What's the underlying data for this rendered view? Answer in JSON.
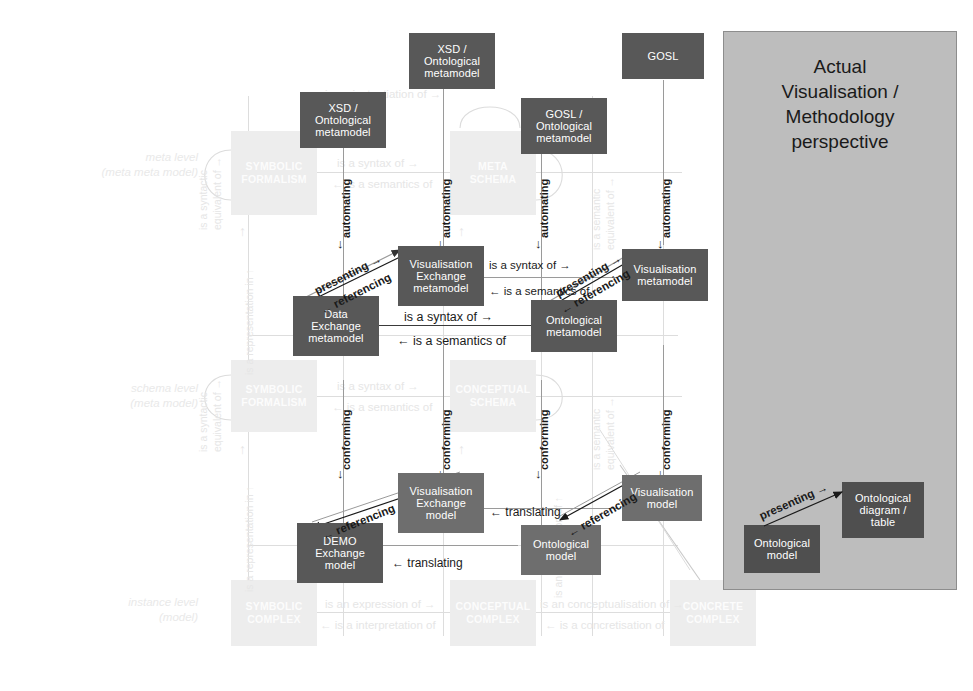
{
  "overlay_panel": {
    "title": "Actual\nVisualisation /\nMethodology\nperspective",
    "bg_color": "#bdbdbd",
    "boxes": [
      {
        "label": "Ontological\nmodel"
      },
      {
        "label": "Ontological\ndiagram /\ntable"
      }
    ],
    "relation": "presenting →"
  },
  "level_labels": [
    {
      "text": "meta level\n(meta meta model)"
    },
    {
      "text": "schema level\n(meta model)"
    },
    {
      "text": "instance level\n(model)"
    }
  ],
  "framework_boxes": [
    {
      "label": "SYMBOLIC\nFORMALISM"
    },
    {
      "label": "META\nSCHEMA"
    },
    {
      "label": "SYMBOLIC\nFORMALISM"
    },
    {
      "label": "CONCEPTUAL\nSCHEMA"
    },
    {
      "label": "SYMBOLIC\nCOMPLEX"
    },
    {
      "label": "CONCEPTUAL\nCOMPLEX"
    },
    {
      "label": "CONCRETE\nCOMPLEX"
    }
  ],
  "dark_boxes": [
    {
      "label": "XSD /\nOntological\nmetamodel"
    },
    {
      "label": "XSD /\nOntological\nmetamodel"
    },
    {
      "label": "GOSL /\nOntological\nmetamodel"
    },
    {
      "label": "GOSL"
    },
    {
      "label": "Visualisation\nExchange\nmetamodel"
    },
    {
      "label": "Data\nExchange\nmetamodel"
    },
    {
      "label": "Ontological\nmetamodel"
    },
    {
      "label": "Visualisation\nmetamodel"
    },
    {
      "label": "Visualisation\nExchange\nmodel"
    },
    {
      "label": "DEMO\nExchange\nmodel"
    },
    {
      "label": "Ontological\nmodel"
    },
    {
      "label": "Visualisation\nmodel"
    }
  ],
  "ghost_relations": [
    {
      "text": "is an instantiation of →"
    },
    {
      "text": "is a syntax of →"
    },
    {
      "text": "← is a semantics of"
    },
    {
      "text": "is a syntax of →"
    },
    {
      "text": "← is a semantics of"
    },
    {
      "text": "is an expression of →"
    },
    {
      "text": "← is a interpretation of"
    },
    {
      "text": "is an conceptualisation of →"
    },
    {
      "text": "← is a concretisation of"
    },
    {
      "text": "is a syntactic\nequivalent of →"
    },
    {
      "text": "is a syntactic\nequivalent of →"
    },
    {
      "text": "is a representation in ↑"
    },
    {
      "text": "is a representation in ↑"
    },
    {
      "text": "is a semantic\nequivalent of →"
    },
    {
      "text": "is a semantic\nequivalent of →"
    },
    {
      "text": "is an instantiation of ↑"
    }
  ],
  "strong_relations": [
    {
      "text": "is a syntax of →"
    },
    {
      "text": "← is a semantics of"
    },
    {
      "text": "is a syntax of →"
    },
    {
      "text": "← is a semantics of"
    },
    {
      "text": "← translating"
    },
    {
      "text": "← translating"
    },
    {
      "text": "automating"
    },
    {
      "text": "automating"
    },
    {
      "text": "automating"
    },
    {
      "text": "automating"
    },
    {
      "text": "conforming"
    },
    {
      "text": "conforming"
    },
    {
      "text": "conforming"
    },
    {
      "text": "conforming"
    },
    {
      "text": "presenting →"
    },
    {
      "text": "← referencing"
    },
    {
      "text": "presenting →"
    },
    {
      "text": "← referencing"
    },
    {
      "text": "← referencing"
    },
    {
      "text": "← referencing"
    }
  ],
  "colors": {
    "dark_box": "#585858",
    "mid_box": "#6e6e6e",
    "ghost_box": "#ededed",
    "panel": "#bdbdbd",
    "text_dark": "#1a1a1a"
  }
}
